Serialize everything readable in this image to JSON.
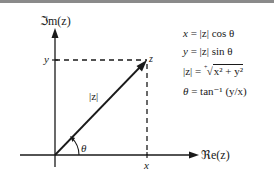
{
  "figure": {
    "axes": {
      "real_axis_label": "ℜe(z)",
      "imag_axis_label": "ℑm(z)",
      "x_tick_label": "x",
      "y_tick_label": "y"
    },
    "point_label": "z",
    "modulus_label": "|z|",
    "angle_label": "θ",
    "equations": [
      {
        "lhs": "x",
        "rhs": "= |z| cos θ"
      },
      {
        "lhs": "y",
        "rhs": "= |z| sin θ"
      },
      {
        "lhs": "|z|",
        "rhs_prefix": "= ",
        "root_index": "+",
        "radicand": "x² + y²"
      },
      {
        "lhs": "θ",
        "rhs": " = tan⁻¹ (y/x)"
      }
    ],
    "colors": {
      "line": "#1a1a1a",
      "topbar": "#8a8a8a"
    }
  }
}
